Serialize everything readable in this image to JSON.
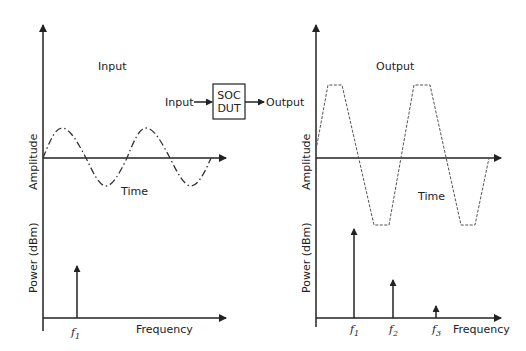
{
  "diagram": {
    "input_panel": {
      "title": "Input",
      "time_plot": {
        "ylabel": "Amplitude",
        "xlabel": "Time",
        "waveform": "sine"
      },
      "spectrum_plot": {
        "ylabel": "Power (dBm)",
        "xlabel": "Frequency",
        "tones": [
          {
            "label": "f",
            "sub": "1"
          }
        ]
      }
    },
    "output_panel": {
      "title": "Output",
      "time_plot": {
        "ylabel": "Amplitude",
        "xlabel": "Time",
        "waveform": "clipped trapezoid"
      },
      "spectrum_plot": {
        "ylabel": "Power (dBm)",
        "xlabel": "Frequency",
        "tones": [
          {
            "label": "f",
            "sub": "1"
          },
          {
            "label": "f",
            "sub": "2"
          },
          {
            "label": "f",
            "sub": "3"
          }
        ]
      }
    },
    "block": {
      "input_label": "Input",
      "line1": "SOC",
      "line2": "DUT",
      "output_label": "Output"
    }
  }
}
